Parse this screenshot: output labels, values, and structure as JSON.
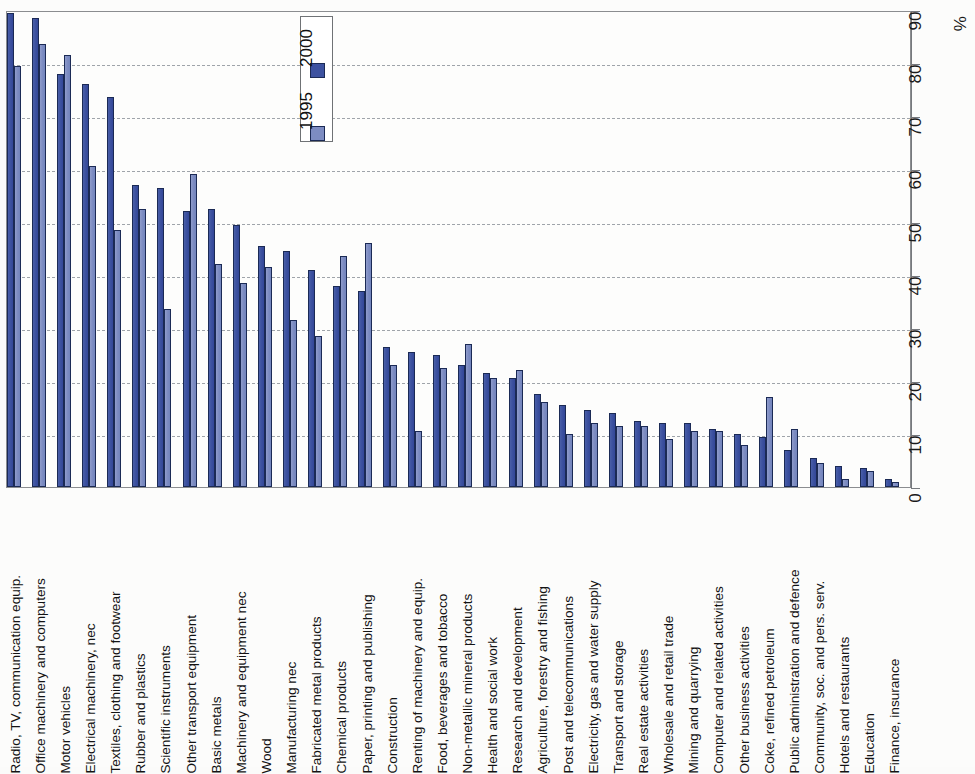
{
  "chart_data": {
    "type": "bar",
    "title": "",
    "subtitle": "",
    "xlabel": "",
    "ylabel": "%",
    "ylim": [
      0,
      90
    ],
    "ytick_step": 10,
    "yticks": [
      "0",
      "10",
      "20",
      "30",
      "40",
      "50",
      "60",
      "70",
      "80",
      "90"
    ],
    "grid": true,
    "orientation": "rotated-90",
    "legend": {
      "position": "top-center-inside",
      "entries": [
        {
          "name": "2000",
          "color": "#3d52a0"
        },
        {
          "name": "1995",
          "color": "#7d8cc2"
        }
      ]
    },
    "categories": [
      "Radio, TV, communication equip.",
      "Office machinery and computers",
      "Motor vehicles",
      "Electrical machinery, nec",
      "Textiles, clothing and footwear",
      "Rubber and plastics",
      "Scientific instruments",
      "Other transport equipment",
      "Basic metals",
      "Machinery and equipment nec",
      "Wood",
      "Manufacturing nec",
      "Fabricated metal products",
      "Chemical products",
      "Paper, printing and publishing",
      "Construction",
      "Renting of machinery and equip.",
      "Food, beverages and tobacco",
      "Non-metallic mineral products",
      "Health and social work",
      "Research and development",
      "Agriculture, forestry and fishing",
      "Post and telecommunications",
      "Electricity, gas and water supply",
      "Transport and storage",
      "Real estate activities",
      "Wholesale and retail trade",
      "Mining and quarrying",
      "Computer and related activities",
      "Other business activities",
      "Coke, refined petroleum",
      "Public administration and defence",
      "Community, soc. and pers. serv.",
      "Hotels and restaurants",
      "Education",
      "Finance, insurance"
    ],
    "series": [
      {
        "name": "2000",
        "color": "#3d52a0",
        "values": [
          89.5,
          88.5,
          78.0,
          76.0,
          73.5,
          57.0,
          56.5,
          52.0,
          52.5,
          49.5,
          45.5,
          44.5,
          41.0,
          38.0,
          37.0,
          26.5,
          25.5,
          25.0,
          23.0,
          21.5,
          20.5,
          17.5,
          15.5,
          14.5,
          14.0,
          12.5,
          12.0,
          12.0,
          11.0,
          10.0,
          9.5,
          7.0,
          5.5,
          4.0,
          3.5,
          1.5
        ]
      },
      {
        "name": "1995",
        "color": "#7d8cc2",
        "values": [
          79.5,
          83.5,
          81.5,
          60.5,
          48.5,
          52.5,
          33.5,
          59.0,
          42.0,
          38.5,
          41.5,
          31.5,
          28.5,
          43.5,
          46.0,
          23.0,
          10.5,
          22.5,
          27.0,
          20.5,
          22.0,
          16.0,
          10.0,
          12.0,
          11.5,
          11.5,
          9.0,
          10.5,
          10.5,
          8.0,
          17.0,
          11.0,
          4.5,
          1.5,
          3.0,
          1.0
        ]
      }
    ]
  }
}
